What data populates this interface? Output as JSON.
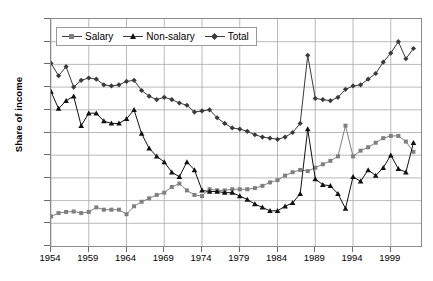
{
  "chart_data": {
    "type": "line",
    "title": "",
    "xlabel": "",
    "ylabel": "Share of income",
    "xlim": [
      1954,
      2003
    ],
    "ylim": [
      0.0,
      10.0
    ],
    "grid": true,
    "legend_position": "top-left-inside",
    "ytick_labels": [
      "10.0",
      "9.0",
      "8.0",
      "7.0",
      "6.0",
      "5.0",
      "4.0",
      "3.0",
      "2.0",
      "1.0",
      "0.0"
    ],
    "ytick_values": [
      10.0,
      9.0,
      8.0,
      7.0,
      6.0,
      5.0,
      4.0,
      3.0,
      2.0,
      1.0,
      0.0
    ],
    "xtick_labels": [
      "1954",
      "1959",
      "1964",
      "1969",
      "1974",
      "1979",
      "1984",
      "1989",
      "1994",
      "1999"
    ],
    "xtick_values": [
      1954,
      1959,
      1964,
      1969,
      1974,
      1979,
      1984,
      1989,
      1994,
      1999
    ],
    "x": [
      1954,
      1955,
      1956,
      1957,
      1958,
      1959,
      1960,
      1961,
      1962,
      1963,
      1964,
      1965,
      1966,
      1967,
      1968,
      1969,
      1970,
      1971,
      1972,
      1973,
      1974,
      1975,
      1976,
      1977,
      1978,
      1979,
      1980,
      1981,
      1982,
      1983,
      1984,
      1985,
      1986,
      1987,
      1988,
      1989,
      1990,
      1991,
      1992,
      1993,
      1994,
      1995,
      1996,
      1997,
      1998,
      1999,
      2000,
      2001,
      2002
    ],
    "series": [
      {
        "name": "Salary",
        "marker": "square",
        "color": "#7f7f7f",
        "values": [
          1.3,
          1.45,
          1.5,
          1.52,
          1.45,
          1.5,
          1.7,
          1.6,
          1.6,
          1.6,
          1.4,
          1.75,
          1.95,
          2.1,
          2.25,
          2.35,
          2.6,
          2.75,
          2.45,
          2.25,
          2.2,
          2.5,
          2.45,
          2.45,
          2.5,
          2.5,
          2.5,
          2.55,
          2.65,
          2.8,
          2.9,
          3.1,
          3.25,
          3.35,
          3.3,
          3.45,
          3.6,
          3.75,
          3.95,
          5.3,
          3.95,
          4.2,
          4.35,
          4.55,
          4.75,
          4.85,
          4.85,
          4.6,
          4.15
        ]
      },
      {
        "name": "Non-salary",
        "marker": "triangle",
        "color": "#111111",
        "values": [
          6.8,
          6.05,
          6.4,
          6.6,
          5.3,
          5.85,
          5.85,
          5.5,
          5.4,
          5.4,
          5.6,
          6.0,
          4.95,
          4.3,
          3.95,
          3.7,
          3.25,
          3.05,
          3.7,
          3.35,
          2.45,
          2.4,
          2.4,
          2.35,
          2.35,
          2.2,
          2.05,
          1.85,
          1.7,
          1.55,
          1.55,
          1.75,
          1.9,
          2.3,
          5.15,
          2.95,
          2.7,
          2.65,
          2.3,
          1.65,
          3.05,
          2.85,
          3.35,
          3.1,
          3.45,
          4.0,
          3.4,
          3.25,
          4.55
        ]
      },
      {
        "name": "Total",
        "marker": "diamond",
        "color": "#3a3a3a",
        "values": [
          8.05,
          7.5,
          7.9,
          7.0,
          7.3,
          7.4,
          7.35,
          7.1,
          7.05,
          7.1,
          7.25,
          7.3,
          6.85,
          6.6,
          6.45,
          6.55,
          6.45,
          6.3,
          6.2,
          5.9,
          5.95,
          6.0,
          5.65,
          5.4,
          5.2,
          5.15,
          5.05,
          4.9,
          4.8,
          4.75,
          4.7,
          4.8,
          5.0,
          5.4,
          8.4,
          6.5,
          6.45,
          6.4,
          6.55,
          6.9,
          7.05,
          7.1,
          7.35,
          7.6,
          8.1,
          8.5,
          9.0,
          8.25,
          8.7
        ]
      }
    ]
  },
  "legend": {
    "items": [
      {
        "label": "Salary"
      },
      {
        "label": "Non-salary"
      },
      {
        "label": "Total"
      }
    ]
  },
  "caption": ""
}
